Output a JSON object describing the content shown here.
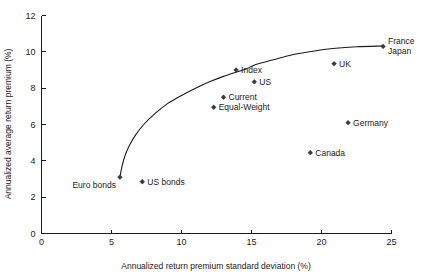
{
  "chart_data": {
    "type": "scatter",
    "title": "",
    "xlabel": "Annualized return premium standard deviation (%)",
    "ylabel": "Annualized average return premium (%)",
    "xlim": [
      0,
      25
    ],
    "ylim": [
      0,
      12
    ],
    "xticks": [
      0,
      5,
      10,
      15,
      20,
      25
    ],
    "yticks": [
      0,
      2,
      4,
      6,
      8,
      10,
      12
    ],
    "xtick_labels": [
      "0",
      "5",
      "10",
      "15",
      "20",
      "25"
    ],
    "ytick_labels": [
      "0",
      "2",
      "4",
      "6",
      "8",
      "10",
      "12"
    ],
    "grid": false,
    "legend": "none",
    "points": [
      {
        "label": "Euro bonds",
        "x": 5.6,
        "y": 3.1,
        "label_pos": "below-left"
      },
      {
        "label": "US bonds",
        "x": 7.2,
        "y": 2.85,
        "label_pos": "right"
      },
      {
        "label": "Equal-Weight",
        "x": 12.3,
        "y": 6.95,
        "label_pos": "right"
      },
      {
        "label": "Current",
        "x": 13.0,
        "y": 7.5,
        "label_pos": "right"
      },
      {
        "label": "Index",
        "x": 13.9,
        "y": 9.0,
        "label_pos": "right"
      },
      {
        "label": "US",
        "x": 15.2,
        "y": 8.35,
        "label_pos": "right"
      },
      {
        "label": "Canada",
        "x": 19.2,
        "y": 4.45,
        "label_pos": "right"
      },
      {
        "label": "UK",
        "x": 20.9,
        "y": 9.35,
        "label_pos": "right"
      },
      {
        "label": "Germany",
        "x": 21.9,
        "y": 6.1,
        "label_pos": "right"
      },
      {
        "label": "France",
        "x": 24.4,
        "y": 10.3,
        "label_pos": "right-upper"
      },
      {
        "label": "Japan",
        "x": 24.4,
        "y": 10.3,
        "label_pos": "right-lower"
      }
    ],
    "curve": {
      "name": "efficient-frontier",
      "points": [
        [
          5.6,
          3.1
        ],
        [
          5.75,
          3.7
        ],
        [
          5.95,
          4.25
        ],
        [
          6.25,
          4.8
        ],
        [
          6.7,
          5.4
        ],
        [
          7.3,
          6.0
        ],
        [
          8.1,
          6.6
        ],
        [
          9.0,
          7.15
        ],
        [
          10.0,
          7.6
        ],
        [
          11.0,
          8.0
        ],
        [
          12.0,
          8.35
        ],
        [
          13.0,
          8.65
        ],
        [
          14.0,
          8.9
        ],
        [
          14.6,
          9.05
        ],
        [
          15.3,
          9.3
        ],
        [
          16.5,
          9.55
        ],
        [
          18.0,
          9.85
        ],
        [
          19.5,
          10.05
        ],
        [
          21.0,
          10.2
        ],
        [
          22.5,
          10.28
        ],
        [
          24.4,
          10.32
        ]
      ]
    }
  },
  "colors": {
    "axis": "#1a1a1a",
    "marker": "#3a3a3a",
    "curve": "#1a1a1a",
    "background": "#ffffff"
  }
}
